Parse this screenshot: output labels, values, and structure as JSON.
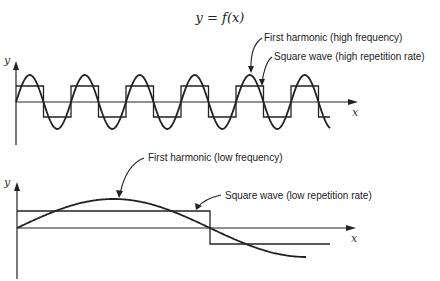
{
  "title": "y = f(x)",
  "top_plot": {
    "y_axis_label": "y",
    "x_axis_label": "x",
    "annotations": [
      "First harmonic (high frequency)",
      "Square wave (high repetition rate)"
    ]
  },
  "bottom_plot": {
    "y_axis_label": "y",
    "x_axis_label": "x",
    "annotations": [
      "First harmonic (low frequency)",
      "Square wave (low repetition rate)"
    ]
  },
  "chart_data": [
    {
      "type": "line",
      "title": "High frequency: square wave vs first harmonic",
      "xlabel": "x",
      "ylabel": "y",
      "series": [
        {
          "name": "First harmonic (high frequency)",
          "shape": "sine",
          "cycles": 5.7,
          "amplitude": 1.0
        },
        {
          "name": "Square wave (high repetition rate)",
          "shape": "square",
          "cycles": 5.7,
          "amplitude": 0.6
        }
      ],
      "grid": false
    },
    {
      "type": "line",
      "title": "Low frequency: square wave vs first harmonic",
      "xlabel": "x",
      "ylabel": "y",
      "series": [
        {
          "name": "First harmonic (low frequency)",
          "shape": "sine",
          "cycles": 0.75,
          "amplitude": 1.0
        },
        {
          "name": "Square wave (low repetition rate)",
          "shape": "square",
          "cycles": 0.55,
          "amplitude": 0.6
        }
      ],
      "grid": false
    }
  ]
}
